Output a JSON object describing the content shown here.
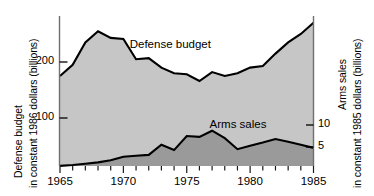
{
  "chart_data": {
    "type": "area",
    "title": "",
    "subtitle": "",
    "x": [
      1965,
      1966,
      1967,
      1968,
      1969,
      1970,
      1971,
      1972,
      1973,
      1974,
      1975,
      1976,
      1977,
      1978,
      1979,
      1980,
      1981,
      1982,
      1983,
      1984,
      1985
    ],
    "xlabel": "",
    "xlim": [
      1965,
      1985
    ],
    "xticks": [
      1965,
      1966,
      1967,
      1968,
      1969,
      1970,
      1971,
      1972,
      1973,
      1974,
      1975,
      1976,
      1977,
      1978,
      1979,
      1980,
      1981,
      1982,
      1983,
      1984,
      1985
    ],
    "xtick_labels": [
      "1965",
      "",
      "",
      "",
      "",
      "1970",
      "",
      "",
      "",
      "",
      "1975",
      "",
      "",
      "",
      "",
      "1980",
      "",
      "",
      "",
      "",
      "1985"
    ],
    "grid": false,
    "legend_position": "inline-annotations",
    "series": [
      {
        "name": "Defense budget",
        "axis": "left",
        "units": "billions of constant 1986 dollars",
        "fill_color": "#c6c6c6",
        "line_color": "#000000",
        "values": [
          175,
          195,
          235,
          255,
          243,
          241,
          205,
          207,
          190,
          180,
          178,
          166,
          182,
          175,
          180,
          190,
          193,
          215,
          235,
          250,
          270
        ]
      },
      {
        "name": "Arms sales",
        "axis": "right",
        "units": "billions of constant 1985 dollars",
        "fill_color": "#9a9a9a",
        "line_color": "#000000",
        "values": [
          0.7,
          0.9,
          1.2,
          1.5,
          2.0,
          2.8,
          3.0,
          3.2,
          5.5,
          4.3,
          7.5,
          7.3,
          8.7,
          7.0,
          4.5,
          5.3,
          6.0,
          6.8,
          6.2,
          5.5,
          4.8
        ]
      }
    ],
    "left_axis": {
      "label_line1": "Defense budget",
      "label_line2": "in constant 1986 dollars (billions)",
      "ticks": [
        100,
        200
      ],
      "tick_labels": [
        "100",
        "200"
      ],
      "ylim": [
        0,
        310
      ]
    },
    "right_axis": {
      "label_line1": "Arms sales",
      "label_line2": "in constant 1985 dollars (billions)",
      "ticks": [
        5,
        10
      ],
      "tick_labels": [
        "5",
        "10"
      ],
      "ylim": [
        0,
        38
      ]
    },
    "annotations": [
      {
        "text": "Defense budget",
        "x": 1970.5,
        "y": 230
      },
      {
        "text": "Arms sales",
        "x": 1976.8,
        "y": 60
      }
    ]
  },
  "figure": {
    "background_color": "#ffffff",
    "defense_fill": "#c6c6c6",
    "arms_fill": "#9a9a9a",
    "axis_color": "#6f6f6f",
    "line_color": "#000000"
  }
}
